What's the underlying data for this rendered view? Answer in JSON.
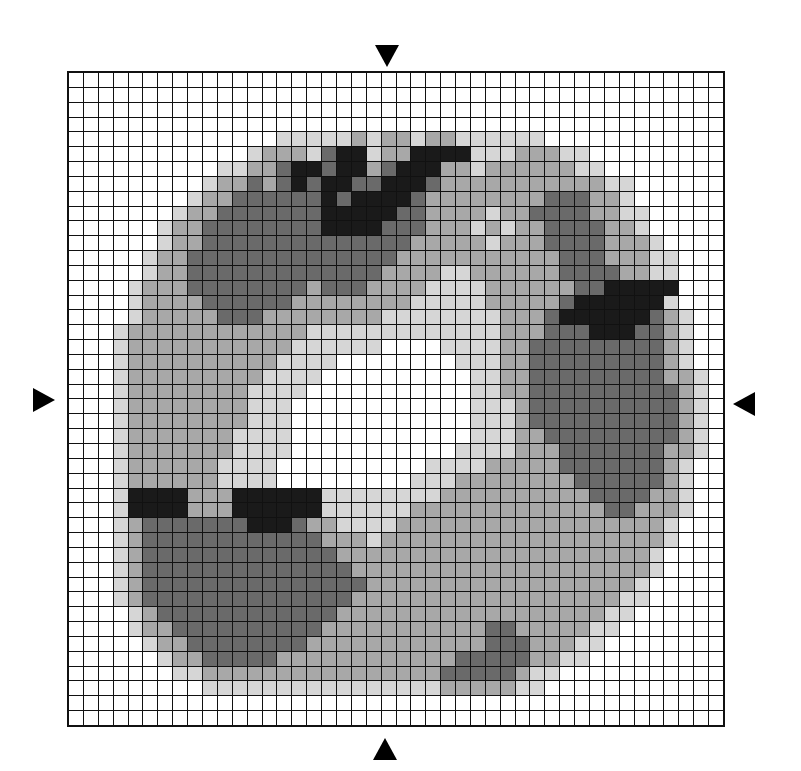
{
  "figure": {
    "type": "grayscale-pixel-grid",
    "rows": 44,
    "cols": 44,
    "shade_levels": {
      "0": "#ffffff",
      "1": "#d6d6d6",
      "2": "#a8a8a8",
      "3": "#6a6a6a",
      "4": "#1a1a1a"
    },
    "markers": [
      {
        "name": "top-arrow",
        "direction": "down",
        "x": 375,
        "y": 45
      },
      {
        "name": "bottom-arrow",
        "direction": "up",
        "x": 373,
        "y": 738
      },
      {
        "name": "left-arrow",
        "direction": "right",
        "x": 33,
        "y": 388
      },
      {
        "name": "right-arrow",
        "direction": "left",
        "x": 733,
        "y": 392
      }
    ],
    "cells_note": "Approximate sketch of the overall shaded layout, not a cell-by-cell transcription. Only the grid edges and arrow markers were inspected at zoom; interior shading is hand-estimated from the overview.",
    "cells": [
      "00000000000000000000000000000000000000000000",
      "00000000000000000000000000000000000000000000",
      "00000000000000000000000000000000000000000000",
      "00000000000000000000000000000000000000000000",
      "00000000000000111112122122111111000000000000",
      "00000000000012221344122444411122211000000000",
      "00000000001122344344234442212222221100000000",
      "00000000012232343443344432222222222211000000",
      "00000000122333333434444322222222333221000000",
      "00000001223333333444443322221223333221100000",
      "00000012233333333444433322212122333322100000",
      "00000012233333333333333222221222333322210000",
      "00000122333333333333332222222222233322211000",
      "00000122333333333333322221122222233332211000",
      "00001222333333332333222211112222223344444000",
      "00001222233333322222222111112222234444441000",
      "00001222223332222222211111111222344444432100",
      "00012222222222221111111111111222333444332100",
      "00012222222222211111100001111223333333332100",
      "00012222222222111100000000111223333333332100",
      "00012222222221111000000000011223333333332210",
      "00012222222211110000000000011223333333333210",
      "00012222222211100000000000011123333333333210",
      "00012222222211100000000000011123333333333210",
      "00012222222111100000000000011122333333333210",
      "00012222222111100000000000111122233333332210",
      "00012222221111000000000011112222233333332100",
      "00012222221111000000000111222222223333332100",
      "00014444222444444111111112222222222333322100",
      "00014444222444444111111222222222222233222100",
      "00012333333344432211112222222222222222221000",
      "00012333333333333222122222222222222222221000",
      "00012333333333333322222222222222222222210000",
      "00012333333333333332222222222222222222210000",
      "00012333333333333333222222222222222222100000",
      "00012333333333333332222222222222222221100000",
      "00001233333333333322222222222222222211000000",
      "00001223333333333222222222223322222110000000",
      "00000122333333332222222222223332221100000000",
      "00000012233333222222222222333332211000000000",
      "00000001122222222222222223333321100000000000",
      "00000000011111111111111112222211000000000000",
      "00000000000000000000000000000000000000000000",
      "00000000000000000000000000000000000000000000"
    ]
  }
}
